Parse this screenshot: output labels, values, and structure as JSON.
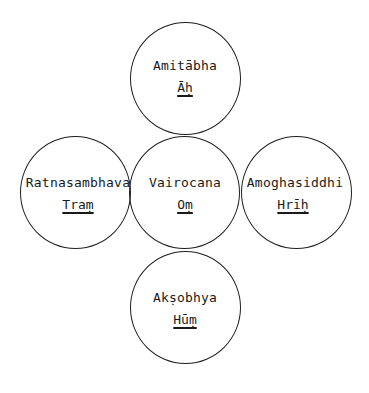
{
  "diagram": {
    "type": "five-circle mandala (cross arrangement)",
    "stroke_color": "#1e1e1e",
    "background": "#ffffff",
    "nodes": [
      {
        "position": "top",
        "name": "Amitābha",
        "mantra": "Āḥ"
      },
      {
        "position": "left",
        "name": "Ratnasambhava",
        "mantra": "Traṃ"
      },
      {
        "position": "center",
        "name": "Vairocana",
        "mantra": "Oṃ"
      },
      {
        "position": "right",
        "name": "Amoghasiddhi",
        "mantra": "Hrīḥ"
      },
      {
        "position": "bottom",
        "name": "Akṣobhya",
        "mantra": "Hūṃ"
      }
    ]
  }
}
